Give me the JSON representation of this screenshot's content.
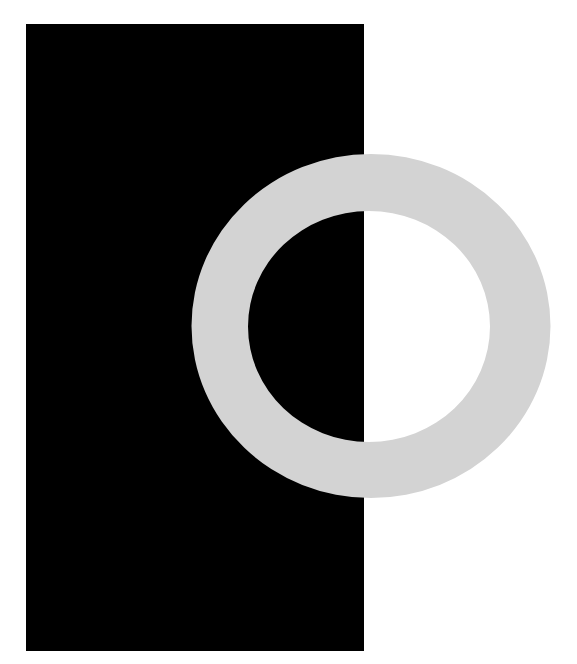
{
  "artwork": {
    "background_color": "#ffffff",
    "rectangle": {
      "x": 26,
      "y": 24,
      "width": 338,
      "height": 627,
      "color": "#000000"
    },
    "ring": {
      "cx": 371,
      "cy": 326,
      "outer_rx": 179.5,
      "outer_ry": 172,
      "inner_cx": 369,
      "inner_cy": 326.5,
      "inner_rx": 121,
      "inner_ry": 115.5,
      "color": "#d3d3d3"
    }
  }
}
